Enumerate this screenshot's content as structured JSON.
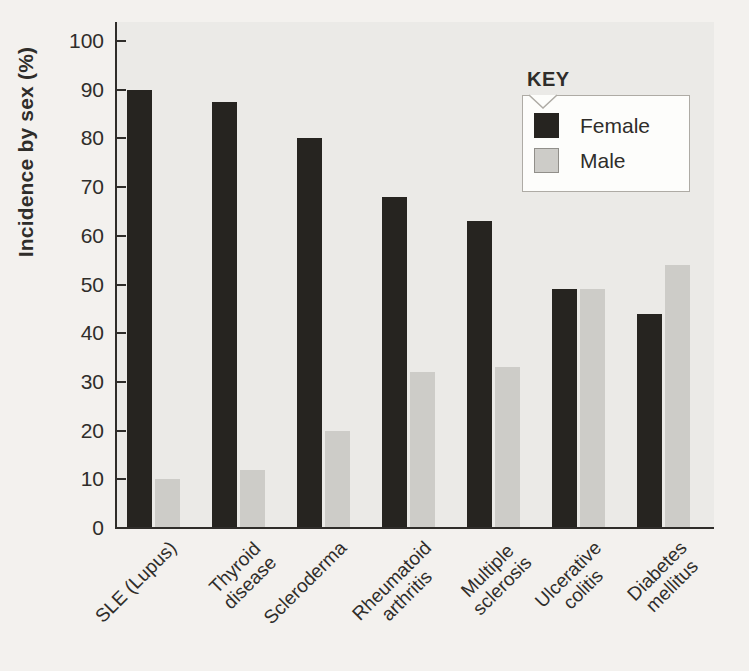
{
  "figure": {
    "background": "#f3f1ee",
    "plot_background": "#ebeae7",
    "axis_color": "#2f2d2a",
    "text_color": "#2f2d2a",
    "legend_box_background": "#fdfdfb",
    "legend_box_border": "#aeaba5"
  },
  "chart_data": {
    "type": "bar",
    "title": "",
    "ylabel": "Incidence by sex (%)",
    "xlabel": "",
    "ylim": [
      0,
      100
    ],
    "yticks": [
      0,
      10,
      20,
      30,
      40,
      50,
      60,
      70,
      80,
      90,
      100
    ],
    "grid": false,
    "legend": {
      "title": "KEY",
      "position": "top-right",
      "entries": [
        "Female",
        "Male"
      ]
    },
    "categories": [
      "SLE (Lupus)",
      "Thyroid\ndisease",
      "Scleroderma",
      "Rheumatoid\narthritis",
      "Multiple\nsclerosis",
      "Ulcerative\ncolitis",
      "Diabetes\nmellitus"
    ],
    "series": [
      {
        "name": "Female",
        "color": "#262420",
        "values": [
          90,
          87.5,
          80,
          68,
          63,
          49,
          44
        ]
      },
      {
        "name": "Male",
        "color": "#cdccc8",
        "swatch_border": "#918f8a",
        "values": [
          10,
          12,
          20,
          32,
          33,
          49,
          54
        ]
      }
    ]
  }
}
